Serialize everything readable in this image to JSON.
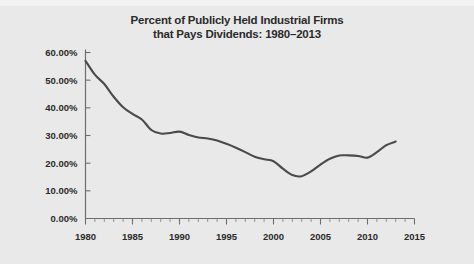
{
  "figure": {
    "background_color": "#e9e9e9",
    "title_line1": "Percent of Publicly Held Industrial Firms",
    "title_line2": "that Pays Dividends: 1980–2013"
  },
  "chart_data": {
    "type": "line",
    "title": "Percent of Publicly Held Industrial Firms that Pays Dividends: 1980–2013",
    "xlabel": "",
    "ylabel": "",
    "xlim": [
      1980,
      2015
    ],
    "ylim": [
      0,
      60
    ],
    "grid": false,
    "legend": "none",
    "line_color": "#4a4a4a",
    "x_tick_labels": [
      "1980",
      "1985",
      "1990",
      "1995",
      "2000",
      "2005",
      "2010",
      "2015"
    ],
    "x_ticks": [
      1980,
      1985,
      1990,
      1995,
      2000,
      2005,
      2010,
      2015
    ],
    "x_minor_tick_interval": 1,
    "y_tick_labels": [
      "0.00%",
      "10.00%",
      "20.00%",
      "30.00%",
      "40.00%",
      "50.00%",
      "60.00%"
    ],
    "y_ticks": [
      0,
      10,
      20,
      30,
      40,
      50,
      60
    ],
    "x": [
      1980,
      1981,
      1982,
      1983,
      1984,
      1985,
      1986,
      1987,
      1988,
      1989,
      1990,
      1991,
      1992,
      1993,
      1994,
      1995,
      1996,
      1997,
      1998,
      1999,
      2000,
      2001,
      2002,
      2003,
      2004,
      2005,
      2006,
      2007,
      2008,
      2009,
      2010,
      2011,
      2012,
      2013
    ],
    "values": [
      57.0,
      52.0,
      48.6,
      44.0,
      40.2,
      37.8,
      35.8,
      32.0,
      30.7,
      30.9,
      31.4,
      30.2,
      29.3,
      28.9,
      28.2,
      27.0,
      25.6,
      24.0,
      22.3,
      21.4,
      20.7,
      18.0,
      15.7,
      15.3,
      17.0,
      19.5,
      21.6,
      22.8,
      22.8,
      22.6,
      22.0,
      24.0,
      26.5,
      27.8
    ],
    "series": [
      {
        "name": "Percent paying dividends",
        "values": [
          57.0,
          52.0,
          48.6,
          44.0,
          40.2,
          37.8,
          35.8,
          32.0,
          30.7,
          30.9,
          31.4,
          30.2,
          29.3,
          28.9,
          28.2,
          27.0,
          25.6,
          24.0,
          22.3,
          21.4,
          20.7,
          18.0,
          15.7,
          15.3,
          17.0,
          19.5,
          21.6,
          22.8,
          22.8,
          22.6,
          22.0,
          24.0,
          26.5,
          27.8
        ]
      }
    ]
  }
}
